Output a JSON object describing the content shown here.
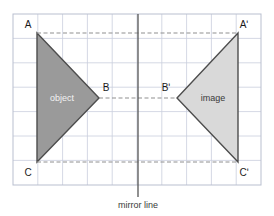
{
  "figure": {
    "title_caption": "mirror line",
    "colors": {
      "object_fill": "#9a9a9a",
      "image_fill": "#d9d9d9",
      "outline": "#4d4d4d",
      "grid_line": "#c9cedd",
      "grid_border": "#b9bfcf",
      "dashed_line": "#8f8f8f",
      "mirror_line": "#555555",
      "object_label_text": "#f2f2f2",
      "image_label_text": "#3a3a3a",
      "vertex_label_text": "#1a1a1a",
      "caption_text": "#3a3a3a",
      "background": "#ffffff"
    },
    "grid": {
      "x0": 13,
      "y0": 14,
      "x1": 261,
      "y1": 185,
      "cell_size": 24.8,
      "columns": 10,
      "rows": 7,
      "visible": true
    },
    "mirror_line": {
      "x": 138,
      "y_top": 14,
      "y_bottom": 197,
      "label": "mirror line",
      "label_x": 138,
      "label_y": 207
    },
    "shapes": [
      {
        "name": "object",
        "label": "object",
        "label_x": 62,
        "label_y": 101,
        "fill": "#9a9a9a",
        "points": "37,33 37,162 99,98"
      },
      {
        "name": "image",
        "label": "image",
        "label_x": 213,
        "label_y": 101,
        "fill": "#d9d9d9",
        "points": "238,33 238,162 177,98"
      }
    ],
    "vertex_labels": [
      {
        "name": "A",
        "text": "A",
        "x": 28,
        "y": 28
      },
      {
        "name": "B",
        "text": "B",
        "x": 106,
        "y": 91
      },
      {
        "name": "C",
        "text": "C",
        "x": 28,
        "y": 176
      },
      {
        "name": "A-prime",
        "text": "Aʹ",
        "x": 244,
        "y": 28
      },
      {
        "name": "B-prime",
        "text": "Bʹ",
        "x": 163,
        "y": 91
      },
      {
        "name": "C-prime",
        "text": "Cʹ",
        "x": 244,
        "y": 176
      }
    ],
    "construction_lines": [
      {
        "name": "A-to-A-prime",
        "x1": 37,
        "y1": 33,
        "x2": 238,
        "y2": 33
      },
      {
        "name": "B-to-B-prime",
        "x1": 99,
        "y1": 98,
        "x2": 177,
        "y2": 98
      },
      {
        "name": "C-to-C-prime",
        "x1": 37,
        "y1": 162,
        "x2": 238,
        "y2": 162
      }
    ]
  }
}
